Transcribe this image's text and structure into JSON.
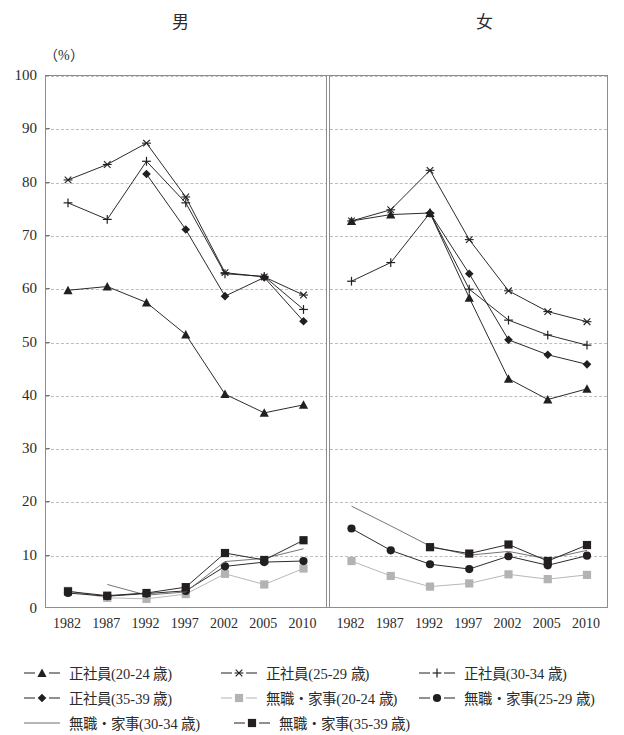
{
  "panels": {
    "male_title": "男",
    "female_title": "女"
  },
  "unit_label": "（%）",
  "legend": {
    "rows": [
      [
        {
          "label": "正社員(20-24 歳)",
          "marker": "triangle",
          "color": "#231f20",
          "icon": "line-triangle-marker-icon"
        },
        {
          "label": "正社員(25-29 歳)",
          "marker": "star",
          "color": "#231f20",
          "icon": "line-star-marker-icon"
        },
        {
          "label": "正社員(30-34 歳)",
          "marker": "plus",
          "color": "#231f20",
          "icon": "line-plus-marker-icon"
        }
      ],
      [
        {
          "label": "正社員(35-39 歳)",
          "marker": "diamond",
          "color": "#231f20",
          "icon": "line-diamond-marker-icon"
        },
        {
          "label": "無職・家事(20-24 歳)",
          "marker": "square",
          "color": "#b3b3b3",
          "icon": "line-square-marker-light-icon"
        },
        {
          "label": "無職・家事(25-29 歳)",
          "marker": "circle",
          "color": "#231f20",
          "icon": "line-circle-marker-icon"
        }
      ],
      [
        {
          "label": "無職・家事(30-34 歳)",
          "marker": "none",
          "color": "#6e6e6e",
          "icon": "plain-line-icon"
        },
        {
          "label": "無職・家事(35-39 歳)",
          "marker": "square",
          "color": "#231f20",
          "icon": "line-square-marker-dark-icon"
        }
      ]
    ]
  },
  "chart_data": {
    "type": "line",
    "title": "",
    "xlabel": "",
    "ylabel": "（%）",
    "ylim": [
      0,
      100
    ],
    "ytick_step": 10,
    "grid": true,
    "legend_position": "bottom",
    "panels": [
      {
        "name": "男",
        "categories": [
          "1982",
          "1987",
          "1992",
          "1997",
          "2002",
          "2005",
          "2010"
        ],
        "series": [
          {
            "name": "正社員(20-24 歳)",
            "marker": "triangle",
            "color": "#231f20",
            "values": [
              59.8,
              60.5,
              57.5,
              51.5,
              40.3,
              36.8,
              38.3
            ]
          },
          {
            "name": "正社員(25-29 歳)",
            "marker": "star",
            "color": "#231f20",
            "values": [
              80.5,
              83.4,
              87.4,
              77.3,
              63.1,
              62.3,
              58.9
            ]
          },
          {
            "name": "正社員(30-34 歳)",
            "marker": "plus",
            "color": "#231f20",
            "values": [
              76.2,
              73.1,
              84.0,
              76.2,
              62.9,
              62.4,
              56.2
            ]
          },
          {
            "name": "正社員(35-39 歳)",
            "marker": "diamond",
            "color": "#231f20",
            "values": [
              null,
              null,
              81.6,
              71.2,
              58.7,
              62.2,
              54.0
            ]
          },
          {
            "name": "無職・家事(20-24 歳)",
            "marker": "square",
            "color": "#b3b3b3",
            "values": [
              3.4,
              2.1,
              1.9,
              2.8,
              6.6,
              4.6,
              7.6
            ]
          },
          {
            "name": "無職・家事(25-29 歳)",
            "marker": "circle",
            "color": "#231f20",
            "values": [
              3.0,
              2.4,
              2.9,
              3.4,
              8.0,
              8.8,
              9.0
            ]
          },
          {
            "name": "無職・家事(30-34 歳)",
            "marker": "none",
            "color": "#6e6e6e",
            "values": [
              null,
              4.6,
              2.6,
              3.2,
              8.9,
              9.5,
              11.3
            ]
          },
          {
            "name": "無職・家事(35-39 歳)",
            "marker": "square",
            "color": "#231f20",
            "values": [
              3.3,
              2.5,
              3.0,
              4.1,
              10.5,
              9.2,
              12.9
            ]
          }
        ]
      },
      {
        "name": "女",
        "categories": [
          "1982",
          "1987",
          "1992",
          "1997",
          "2002",
          "2005",
          "2010"
        ],
        "series": [
          {
            "name": "正社員(20-24 歳)",
            "marker": "triangle",
            "color": "#231f20",
            "values": [
              72.8,
              74.0,
              74.3,
              58.4,
              43.2,
              39.3,
              41.3
            ]
          },
          {
            "name": "正社員(25-29 歳)",
            "marker": "star",
            "color": "#231f20",
            "values": [
              72.8,
              74.9,
              82.3,
              69.3,
              59.7,
              55.8,
              53.9
            ]
          },
          {
            "name": "正社員(30-34 歳)",
            "marker": "plus",
            "color": "#231f20",
            "values": [
              61.5,
              65.0,
              74.3,
              60.0,
              54.2,
              51.4,
              49.5
            ]
          },
          {
            "name": "正社員(35-39 歳)",
            "marker": "diamond",
            "color": "#231f20",
            "values": [
              null,
              null,
              74.3,
              62.9,
              50.5,
              47.7,
              45.9
            ]
          },
          {
            "name": "無職・家事(20-24 歳)",
            "marker": "square",
            "color": "#b3b3b3",
            "values": [
              9.0,
              6.2,
              4.2,
              4.8,
              6.5,
              5.6,
              6.4
            ]
          },
          {
            "name": "無職・家事(25-29 歳)",
            "marker": "circle",
            "color": "#231f20",
            "values": [
              15.1,
              11.0,
              8.4,
              7.5,
              9.9,
              8.2,
              10.0
            ]
          },
          {
            "name": "無職・家事(30-34 歳)",
            "marker": "none",
            "color": "#6e6e6e",
            "values": [
              19.3,
              15.6,
              11.8,
              10.1,
              10.8,
              9.4,
              11.0
            ]
          },
          {
            "name": "無職・家事(35-39 歳)",
            "marker": "square",
            "color": "#231f20",
            "values": [
              null,
              null,
              11.6,
              10.4,
              12.1,
              9.0,
              12.0
            ]
          }
        ]
      }
    ],
    "ytick_labels": [
      "100",
      "90",
      "80",
      "70",
      "60",
      "50",
      "40",
      "30",
      "20",
      "10",
      "0"
    ]
  }
}
